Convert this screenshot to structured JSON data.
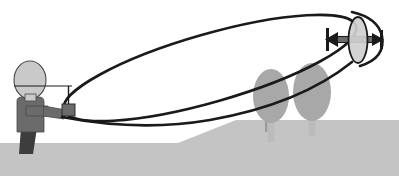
{
  "illustration": {
    "title": "Radio-controlled aircraft elliptical flight path over hill",
    "description": "Line drawing of a standing operator holding a remote control transmitter, with a long tilted elliptical flight path looping out to a flying disc-shaped craft above two trees on a hill.",
    "width": 399,
    "height": 176,
    "background_color": "#ffffff"
  },
  "colors": {
    "outline": "#1a1a1a",
    "body_fill": "#6b6b6b",
    "leg_fill": "#3d3d3d",
    "head_fill": "#c9c9c9",
    "ground_fill": "#cfcfcf",
    "hill_fill": "#c4c4c4",
    "tree_fill": "#a8a8a8",
    "trunk_fill": "#bcbcbc",
    "craft_fill": "#cfcfcf",
    "arrow_fill": "#6b6b6b",
    "transmitter_fill": "#6b6b6b",
    "background": "#ffffff"
  },
  "ground": {
    "name": "ground-plane",
    "flat_band_top_y": 143,
    "hill_crest_y": 120
  },
  "operator": {
    "name": "operator-figure",
    "head": {
      "cx": 30,
      "cy": 80,
      "rx": 16,
      "ry": 19
    },
    "torso": {
      "x": 17,
      "y": 99,
      "width": 26,
      "height": 33
    },
    "leg": {
      "x": 21,
      "y": 128,
      "width": 16,
      "height": 26
    },
    "arm_label": "extended-arm",
    "sight_line_label": "line-of-sight"
  },
  "transmitter": {
    "name": "remote-control-transmitter",
    "body": {
      "x": 62,
      "y": 104,
      "width": 12,
      "height": 11
    },
    "antenna": {
      "x": 68,
      "y_top": 86,
      "y_bottom": 104
    }
  },
  "flight_path": {
    "name": "elliptical-flight-path",
    "shape": "ellipse",
    "center_x": 210,
    "center_y": 68,
    "rx": 152,
    "ry": 34,
    "rotation_deg": -16,
    "stroke_width": 2.6
  },
  "aircraft": {
    "name": "flying-craft",
    "disc": {
      "cx": 358,
      "cy": 40,
      "rx": 9,
      "ry": 22
    },
    "arrow_label": "thrust-vector-arrow",
    "arrow_y": 40,
    "arrow_x_left": 325,
    "arrow_x_right": 381
  },
  "trees": [
    {
      "name": "tree-left",
      "cx": 271,
      "cy": 96,
      "rx": 18,
      "ry": 26,
      "trunk_x": 268,
      "trunk_y": 120,
      "trunk_w": 7,
      "trunk_h": 22
    },
    {
      "name": "tree-right",
      "cx": 312,
      "cy": 92,
      "rx": 19,
      "ry": 28,
      "trunk_x": 309,
      "trunk_y": 118,
      "trunk_w": 7,
      "trunk_h": 20
    }
  ],
  "antenna_pole": {
    "name": "hill-antenna-pole",
    "x": 266,
    "y_top": 120,
    "y_bottom": 131
  }
}
